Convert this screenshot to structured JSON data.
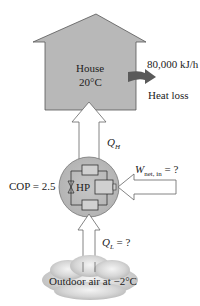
{
  "house": {
    "label": "House",
    "temperature": "20°C",
    "fill_color": "#b8b8b8"
  },
  "heat_loss": {
    "rate": "80,000 kJ/h",
    "label": "Heat loss",
    "arrow_color": "#5a5a5a"
  },
  "heat_pump": {
    "label": "HP",
    "cop_label": "COP = 2.5",
    "fill_color": "#bdbdbd"
  },
  "flows": {
    "q_high": "Q",
    "q_high_sub": "H",
    "q_low": "Q",
    "q_low_sub": "L",
    "q_low_suffix": " = ?",
    "w_net": "W",
    "w_net_sub": "net, in",
    "w_net_suffix": " = ?"
  },
  "outdoor": {
    "label": "Outdoor air at −2°C"
  }
}
